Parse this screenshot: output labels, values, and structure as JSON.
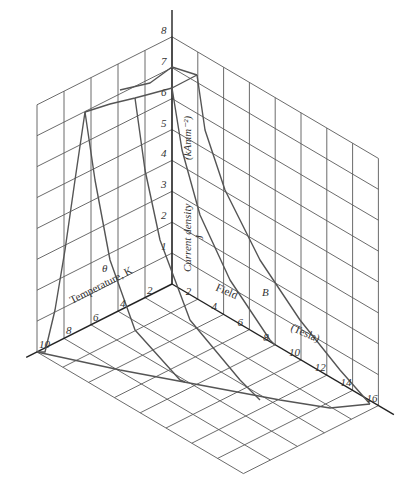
{
  "diagram": {
    "axes": {
      "current_density": {
        "label": "Current density",
        "symbol": "J",
        "unit": "(kAmm⁻²)",
        "ticks": [
          "1",
          "2",
          "3",
          "4",
          "5",
          "6",
          "7",
          "8"
        ]
      },
      "temperature": {
        "label": "Temperature, K",
        "symbol": "θ",
        "ticks": [
          "2",
          "4",
          "6",
          "8",
          "10"
        ]
      },
      "field": {
        "label": "Field",
        "symbol": "B",
        "unit": "(Tesla)",
        "ticks": [
          "2",
          "4",
          "6",
          "8",
          "10",
          "12",
          "14",
          "16"
        ]
      }
    },
    "projection": {
      "origin": [
        172,
        284
      ],
      "t_unit": [
        -13.5,
        6.8
      ],
      "b_unit": [
        12.9,
        7.6
      ],
      "j_unit": [
        0,
        -30.9
      ]
    },
    "ranges": {
      "T": [
        0,
        10
      ],
      "B": [
        0,
        16
      ],
      "J": [
        0,
        8
      ]
    },
    "curves": [
      {
        "name": "B0-temperature-ridge",
        "points": [
          [
            172,
            88
          ],
          [
            150,
            94
          ],
          [
            135,
            98
          ],
          [
            110,
            104
          ],
          [
            85,
            112
          ]
        ]
      },
      {
        "name": "T0-field-ridge",
        "points": [
          [
            172,
            88
          ],
          [
            197,
            75
          ]
        ]
      },
      {
        "name": "upper-ridge",
        "points": [
          [
            197,
            75
          ],
          [
            172,
            67
          ],
          [
            150,
            83
          ],
          [
            120,
            90
          ]
        ]
      },
      {
        "name": "outer-field-curve",
        "points": [
          [
            197,
            75
          ],
          [
            205,
            130
          ],
          [
            225,
            190
          ],
          [
            260,
            260
          ],
          [
            300,
            320
          ],
          [
            340,
            370
          ],
          [
            370,
            404
          ]
        ]
      },
      {
        "name": "inner-field-curve",
        "points": [
          [
            172,
            88
          ],
          [
            182,
            150
          ],
          [
            200,
            215
          ],
          [
            230,
            280
          ],
          [
            270,
            340
          ],
          [
            275,
            345
          ]
        ]
      },
      {
        "name": "left-temp-curve-a",
        "points": [
          [
            85,
            112
          ],
          [
            75,
            180
          ],
          [
            65,
            250
          ],
          [
            55,
            310
          ],
          [
            45,
            352
          ],
          [
            37,
            352
          ]
        ]
      },
      {
        "name": "left-temp-curve-b",
        "points": [
          [
            85,
            112
          ],
          [
            95,
            180
          ],
          [
            110,
            260
          ],
          [
            135,
            330
          ],
          [
            180,
            380
          ],
          [
            185,
            382
          ]
        ]
      },
      {
        "name": "left-temp-curve-c",
        "points": [
          [
            135,
            98
          ],
          [
            145,
            170
          ],
          [
            160,
            240
          ],
          [
            190,
            320
          ],
          [
            240,
            380
          ],
          [
            260,
            400
          ]
        ]
      },
      {
        "name": "floor-boundary",
        "points": [
          [
            37,
            352
          ],
          [
            120,
            370
          ],
          [
            200,
            385
          ],
          [
            280,
            400
          ],
          [
            330,
            408
          ],
          [
            370,
            404
          ]
        ]
      }
    ]
  }
}
